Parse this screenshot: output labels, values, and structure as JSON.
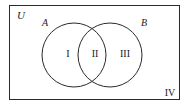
{
  "diagram": {
    "type": "venn",
    "universe_label": "U",
    "sets": [
      {
        "label": "A",
        "cx": 74,
        "cy": 55,
        "r": 32
      },
      {
        "label": "B",
        "cx": 110,
        "cy": 55,
        "r": 32
      }
    ],
    "regions": [
      {
        "label": "I",
        "description": "A only"
      },
      {
        "label": "II",
        "description": "A and B"
      },
      {
        "label": "III",
        "description": "B only"
      },
      {
        "label": "IV",
        "description": "neither A nor B"
      }
    ],
    "colors": {
      "stroke": "#2a2a2a",
      "background": "#ffffff"
    }
  }
}
